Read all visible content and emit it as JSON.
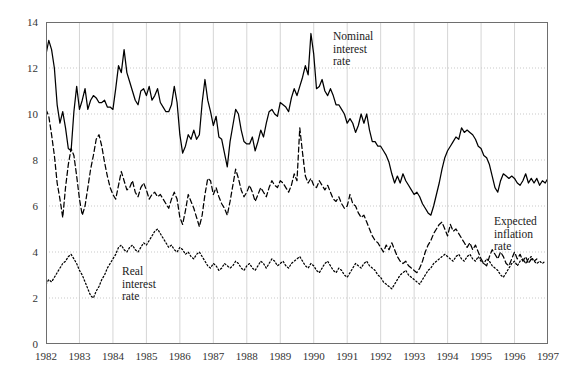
{
  "chart_data": {
    "type": "line",
    "title": "",
    "xlabel": "",
    "ylabel": "",
    "xlim": [
      1982,
      1997
    ],
    "ylim": [
      0,
      14
    ],
    "grid": true,
    "legend_position": "inline-annotations",
    "y_ticks": [
      "0",
      "2",
      "4",
      "6",
      "8",
      "10",
      "12",
      "14"
    ],
    "x_ticks": [
      "1982",
      "1983",
      "1984",
      "1985",
      "1986",
      "1987",
      "1988",
      "1989",
      "1990",
      "1991",
      "1992",
      "1993",
      "1994",
      "1995",
      "1996",
      "1997"
    ],
    "annotations": [
      {
        "name": "nominal-interest-rate-label",
        "text": "Nominal\ninterest\nrate"
      },
      {
        "name": "expected-inflation-rate-label",
        "text": "Expected\ninflation\nrate"
      },
      {
        "name": "real-interest-rate-label",
        "text": "Real\ninterest\nrate"
      }
    ],
    "x_start": 1982.0,
    "x_step": 0.08333,
    "series": [
      {
        "name": "Nominal interest rate",
        "style": "solid",
        "color": "#000000",
        "values": [
          12.6,
          13.2,
          12.8,
          12.0,
          10.4,
          9.6,
          10.1,
          9.4,
          8.5,
          8.4,
          10.1,
          11.2,
          10.2,
          10.6,
          11.1,
          10.2,
          10.6,
          10.8,
          10.7,
          10.5,
          10.5,
          10.6,
          10.3,
          10.3,
          10.2,
          11.1,
          12.1,
          11.8,
          12.8,
          11.8,
          11.4,
          11.0,
          10.6,
          10.4,
          11.0,
          11.1,
          10.8,
          11.2,
          10.6,
          10.8,
          11.1,
          10.5,
          10.3,
          10.1,
          10.1,
          10.4,
          11.2,
          10.5,
          9.1,
          8.3,
          8.6,
          9.1,
          8.9,
          9.3,
          8.9,
          9.1,
          10.5,
          11.5,
          10.6,
          10.1,
          9.5,
          9.9,
          9.0,
          8.9,
          8.3,
          7.7,
          8.8,
          9.5,
          10.2,
          10.0,
          9.3,
          8.8,
          8.7,
          8.7,
          9.0,
          8.4,
          8.8,
          9.3,
          9.0,
          9.6,
          10.1,
          10.2,
          10.0,
          9.9,
          10.5,
          10.4,
          10.3,
          10.1,
          10.7,
          11.1,
          10.8,
          11.2,
          11.6,
          12.1,
          11.7,
          13.5,
          12.6,
          11.1,
          11.2,
          11.5,
          11.0,
          10.8,
          11.1,
          10.8,
          10.4,
          10.4,
          10.2,
          10.0,
          9.6,
          9.8,
          9.6,
          9.2,
          9.5,
          10.0,
          9.6,
          10.0,
          9.3,
          8.8,
          8.8,
          8.6,
          8.6,
          8.4,
          8.2,
          7.9,
          7.4,
          7.0,
          7.3,
          7.0,
          7.4,
          7.1,
          6.9,
          6.7,
          6.5,
          6.6,
          6.4,
          6.1,
          5.9,
          5.7,
          5.6,
          6.0,
          6.5,
          7.0,
          7.6,
          8.1,
          8.4,
          8.6,
          8.8,
          9.0,
          8.9,
          9.4,
          9.2,
          9.3,
          9.2,
          9.1,
          8.9,
          8.6,
          8.5,
          8.2,
          8.1,
          7.8,
          7.3,
          6.8,
          6.6,
          7.1,
          7.4,
          7.3,
          7.2,
          7.3,
          7.2,
          7.0,
          6.9,
          7.1,
          7.4,
          7.0,
          7.2,
          7.0,
          7.2,
          6.9,
          7.1,
          7.0,
          7.2
        ]
      },
      {
        "name": "Expected inflation rate",
        "style": "dashed",
        "color": "#000000",
        "values": [
          10.2,
          9.9,
          9.1,
          8.2,
          7.0,
          6.3,
          5.5,
          6.8,
          7.8,
          8.5,
          8.2,
          7.3,
          6.3,
          5.6,
          6.0,
          6.8,
          7.6,
          8.2,
          8.9,
          9.1,
          8.6,
          7.9,
          7.3,
          6.8,
          6.5,
          6.3,
          6.9,
          7.5,
          7.1,
          6.7,
          6.8,
          7.1,
          6.6,
          6.4,
          6.8,
          7.0,
          6.7,
          6.3,
          6.5,
          6.6,
          6.4,
          6.5,
          6.3,
          6.1,
          5.9,
          6.3,
          6.6,
          6.3,
          5.5,
          5.2,
          5.8,
          6.5,
          6.2,
          5.9,
          5.5,
          5.1,
          5.6,
          6.5,
          7.2,
          7.1,
          6.5,
          6.8,
          6.4,
          6.1,
          5.9,
          5.6,
          6.2,
          6.9,
          7.6,
          7.2,
          6.7,
          6.4,
          6.6,
          6.9,
          6.6,
          6.2,
          6.5,
          6.8,
          6.6,
          6.4,
          6.8,
          7.1,
          6.9,
          6.8,
          7.1,
          7.0,
          6.8,
          6.6,
          6.9,
          7.4,
          7.1,
          9.4,
          8.3,
          7.3,
          7.0,
          7.2,
          6.9,
          6.8,
          7.1,
          6.9,
          6.7,
          6.9,
          6.6,
          6.3,
          6.2,
          6.4,
          6.1,
          5.9,
          6.0,
          6.5,
          6.1,
          6.0,
          5.7,
          5.5,
          5.6,
          5.3,
          5.0,
          4.7,
          4.5,
          4.4,
          4.2,
          4.0,
          4.3,
          4.1,
          4.4,
          4.1,
          3.8,
          3.6,
          3.5,
          3.6,
          3.4,
          3.3,
          3.2,
          3.1,
          3.3,
          3.6,
          4.0,
          4.3,
          4.5,
          4.8,
          5.0,
          5.2,
          5.3,
          5.0,
          4.7,
          5.2,
          4.9,
          5.0,
          4.8,
          4.6,
          4.4,
          4.2,
          4.4,
          4.1,
          4.3,
          4.0,
          3.7,
          3.5,
          3.4,
          3.8,
          4.1,
          3.9,
          3.7,
          4.0,
          3.8,
          3.5,
          3.4,
          3.7,
          4.0,
          3.7,
          3.9,
          3.6,
          3.8,
          3.5,
          3.7,
          3.6,
          3.7
        ]
      },
      {
        "name": "Real interest rate",
        "style": "dotted",
        "color": "#000000",
        "values": [
          2.6,
          2.8,
          2.7,
          2.9,
          3.1,
          3.3,
          3.5,
          3.6,
          3.8,
          3.9,
          3.7,
          3.5,
          3.2,
          3.0,
          2.7,
          2.4,
          2.1,
          2.0,
          2.3,
          2.5,
          2.8,
          3.0,
          3.3,
          3.5,
          3.7,
          3.9,
          4.2,
          4.3,
          4.1,
          4.0,
          4.2,
          4.3,
          4.1,
          4.0,
          4.2,
          4.4,
          4.3,
          4.5,
          4.7,
          4.9,
          5.0,
          4.8,
          4.6,
          4.4,
          4.2,
          4.3,
          4.1,
          4.0,
          4.2,
          4.1,
          3.9,
          4.0,
          3.8,
          3.7,
          3.9,
          4.0,
          3.8,
          3.6,
          3.4,
          3.3,
          3.5,
          3.4,
          3.2,
          3.3,
          3.5,
          3.4,
          3.3,
          3.4,
          3.6,
          3.5,
          3.3,
          3.2,
          3.4,
          3.5,
          3.3,
          3.2,
          3.4,
          3.6,
          3.5,
          3.3,
          3.5,
          3.7,
          3.6,
          3.4,
          3.5,
          3.6,
          3.4,
          3.3,
          3.5,
          3.6,
          3.7,
          3.8,
          3.6,
          3.4,
          3.3,
          3.5,
          3.4,
          3.2,
          3.1,
          3.3,
          3.5,
          3.6,
          3.4,
          3.2,
          3.1,
          3.3,
          3.2,
          3.0,
          2.9,
          3.1,
          3.3,
          3.5,
          3.4,
          3.3,
          3.5,
          3.6,
          3.4,
          3.3,
          3.2,
          3.0,
          2.9,
          2.7,
          2.6,
          2.5,
          2.4,
          2.6,
          2.8,
          3.0,
          3.1,
          3.2,
          3.0,
          2.9,
          2.8,
          2.7,
          2.6,
          2.8,
          3.0,
          3.2,
          3.3,
          3.5,
          3.6,
          3.7,
          3.8,
          3.9,
          3.8,
          3.7,
          3.6,
          3.8,
          3.9,
          3.7,
          3.6,
          3.8,
          3.9,
          3.7,
          3.6,
          3.8,
          3.6,
          3.5,
          3.7,
          3.6,
          3.4,
          3.3,
          3.2,
          3.0,
          2.9,
          3.1,
          3.3,
          3.5,
          3.6,
          3.4,
          3.6,
          3.7,
          3.5,
          3.7,
          3.8,
          3.6,
          3.5,
          3.6,
          3.5,
          3.6
        ]
      }
    ]
  },
  "axes": {
    "y_axis_name": "value-axis",
    "x_axis_name": "year-axis"
  }
}
